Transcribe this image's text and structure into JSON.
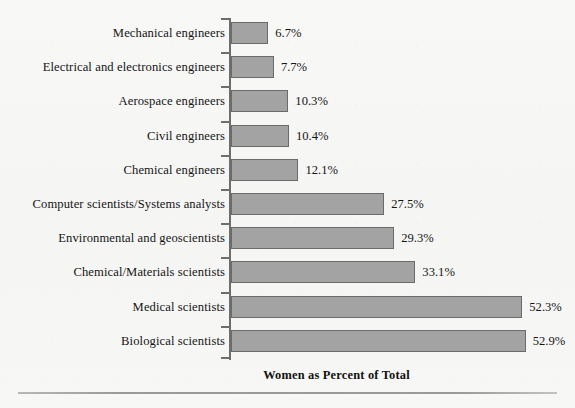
{
  "chart_data": {
    "type": "bar",
    "orientation": "horizontal",
    "title": "",
    "xlabel": "Women as Percent of Total",
    "ylabel": "",
    "xlim": [
      0,
      55
    ],
    "grid": false,
    "legend": null,
    "value_suffix": "%",
    "categories": [
      "Mechanical engineers",
      "Electrical and electronics engineers",
      "Aerospace engineers",
      "Civil engineers",
      "Chemical engineers",
      "Computer scientists/Systems analysts",
      "Environmental and geoscientists",
      "Chemical/Materials scientists",
      "Medical scientists",
      "Biological scientists"
    ],
    "values": [
      6.7,
      7.7,
      10.3,
      10.4,
      12.1,
      27.5,
      29.3,
      33.1,
      52.3,
      52.9
    ],
    "data_labels": [
      "6.7%",
      "7.7%",
      "10.3%",
      "10.4%",
      "12.1%",
      "27.5%",
      "29.3%",
      "33.1%",
      "52.3%",
      "52.9%"
    ]
  },
  "style": {
    "bar_fill": "#a3a3a3",
    "bar_border": "#6b6b6b",
    "axis_color": "#6e6e6e",
    "background": "#f7f7f5",
    "text_color": "#151515"
  }
}
